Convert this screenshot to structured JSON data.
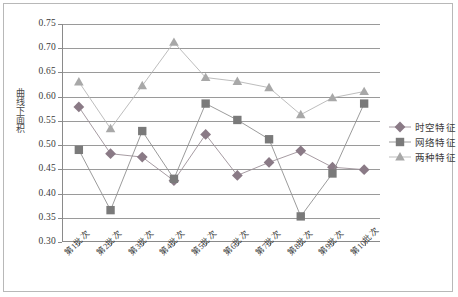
{
  "chart_data": {
    "type": "line",
    "title": "",
    "xlabel": "",
    "ylabel": "曲线下面积",
    "ylim": [
      0.3,
      0.75
    ],
    "ytick_step": 0.05,
    "grid": true,
    "legend_position": "right",
    "categories": [
      "第1批次",
      "第2批次",
      "第3批次",
      "第4批次",
      "第5批次",
      "第6批次",
      "第7批次",
      "第8批次",
      "第9批次",
      "第10批次"
    ],
    "yticks": [
      "0.75",
      "0.70",
      "0.65",
      "0.60",
      "0.55",
      "0.50",
      "0.45",
      "0.40",
      "0.35",
      "0.30"
    ],
    "series": [
      {
        "name": "时空特征",
        "marker": "diamond",
        "color": "#8a7a86",
        "line_color": "#9b8f97",
        "values": [
          0.578,
          0.481,
          0.474,
          0.425,
          0.521,
          0.436,
          0.463,
          0.487,
          0.453,
          0.448
        ]
      },
      {
        "name": "网络特征",
        "marker": "square",
        "color": "#7a7a7a",
        "line_color": "#8f8f8f",
        "values": [
          0.489,
          0.364,
          0.528,
          0.429,
          0.585,
          0.551,
          0.511,
          0.351,
          0.44,
          0.585
        ]
      },
      {
        "name": "两种特征",
        "marker": "triangle",
        "color": "#a8a8a8",
        "line_color": "#b5b5b5",
        "values": [
          0.63,
          0.533,
          0.622,
          0.712,
          0.639,
          0.631,
          0.618,
          0.562,
          0.597,
          0.61
        ]
      }
    ]
  },
  "legend": {
    "items": [
      {
        "label": "时空特征"
      },
      {
        "label": "网络特征"
      },
      {
        "label": "两种特征"
      }
    ]
  },
  "axes": {
    "y_title": "曲线下面积"
  },
  "colors": {
    "frame": "#b8b8b8",
    "axis": "#8a8a8a",
    "grid": "#9a9a9a",
    "background": "#ffffff",
    "series_diamond": "#8a7a86",
    "series_square": "#7a7a7a",
    "series_triangle": "#a8a8a8"
  }
}
